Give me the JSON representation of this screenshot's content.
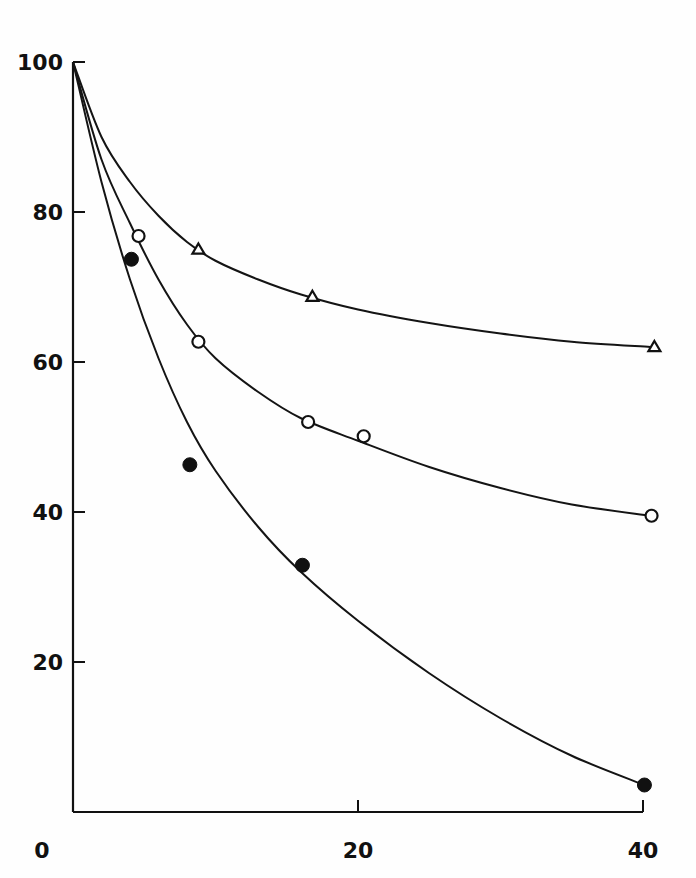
{
  "chart_data": {
    "type": "line",
    "title": "",
    "xlabel": "",
    "ylabel": "",
    "xlim": [
      0,
      40
    ],
    "ylim": [
      0,
      100
    ],
    "grid": false,
    "legend": null,
    "x_ticks": [
      {
        "value": 0,
        "label": "0"
      },
      {
        "value": 20,
        "label": "20"
      },
      {
        "value": 40,
        "label": "40"
      }
    ],
    "y_ticks": [
      {
        "value": 100,
        "label": "100"
      },
      {
        "value": 80,
        "label": "80"
      },
      {
        "value": 60,
        "label": "60"
      },
      {
        "value": 40,
        "label": "40"
      },
      {
        "value": 20,
        "label": "20"
      }
    ],
    "series": [
      {
        "name": "triangles",
        "marker": "open-triangle",
        "points": [
          [
            0,
            100
          ],
          [
            8.8,
            75
          ],
          [
            16.8,
            68.7
          ],
          [
            40.8,
            62
          ]
        ],
        "fit_curve": [
          [
            0,
            100
          ],
          [
            2,
            90
          ],
          [
            4,
            84
          ],
          [
            6,
            79.5
          ],
          [
            8,
            76
          ],
          [
            10,
            73.5
          ],
          [
            13,
            71
          ],
          [
            16,
            69
          ],
          [
            20,
            67
          ],
          [
            25,
            65.2
          ],
          [
            30,
            63.8
          ],
          [
            35,
            62.7
          ],
          [
            40.5,
            62
          ]
        ]
      },
      {
        "name": "open circles",
        "marker": "open-circle",
        "points": [
          [
            0,
            100
          ],
          [
            4.6,
            76.8
          ],
          [
            8.8,
            62.7
          ],
          [
            16.5,
            52
          ],
          [
            20.4,
            50.1
          ],
          [
            40.6,
            39.5
          ]
        ],
        "fit_curve": [
          [
            0,
            100
          ],
          [
            2,
            87
          ],
          [
            4,
            78.5
          ],
          [
            6,
            71
          ],
          [
            8,
            65
          ],
          [
            10,
            60.5
          ],
          [
            13,
            56
          ],
          [
            16,
            52.5
          ],
          [
            20,
            49.5
          ],
          [
            25,
            46
          ],
          [
            30,
            43.2
          ],
          [
            35,
            41
          ],
          [
            40.5,
            39.5
          ]
        ]
      },
      {
        "name": "filled circles",
        "marker": "filled-circle",
        "points": [
          [
            0,
            100
          ],
          [
            4.1,
            73.7
          ],
          [
            8.2,
            46.3
          ],
          [
            16.1,
            32.9
          ],
          [
            40.1,
            3.6
          ]
        ],
        "fit_curve": [
          [
            0,
            100
          ],
          [
            2,
            84
          ],
          [
            4,
            71
          ],
          [
            6,
            60.5
          ],
          [
            8,
            52
          ],
          [
            10,
            45.5
          ],
          [
            13,
            38
          ],
          [
            16,
            32
          ],
          [
            20,
            25.5
          ],
          [
            25,
            18.5
          ],
          [
            30,
            12.5
          ],
          [
            35,
            7.5
          ],
          [
            40.1,
            3.6
          ]
        ]
      }
    ]
  },
  "plot_area": {
    "origin_px": [
      73,
      812
    ],
    "x_px_per_unit": 14.25,
    "y_px_per_unit": 7.5
  }
}
